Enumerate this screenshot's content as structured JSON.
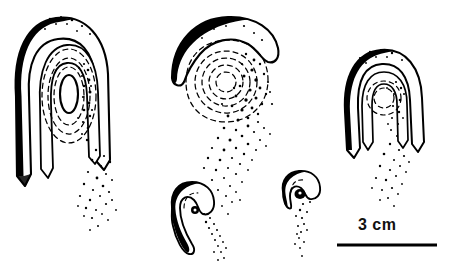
{
  "figure": {
    "background_color": "#ffffff",
    "ink_color": "#000000",
    "width": 449,
    "height": 279
  },
  "scale_bar": {
    "label": "3 cm",
    "value": 3,
    "unit": "cm",
    "bar_color": "#000000",
    "bar_x_start": 337,
    "bar_x_end": 437,
    "bar_y": 245,
    "bar_thickness": 3,
    "label_x": 358,
    "label_y": 216
  },
  "specimens": [
    {
      "id": "specimen-large-left",
      "name": "large-left-specimen",
      "description": "Large inverted-U hook with concentric dashed oval rings, solid inner oval, thick stippled left margin and descending spore trail",
      "size_class": "large",
      "center_x": 62,
      "center_y": 100,
      "has_dashed_rings": true,
      "ring_count": 4,
      "has_solid_core": true,
      "has_spore_trail": true,
      "trail_direction": "down"
    },
    {
      "id": "specimen-middle-large",
      "name": "middle-crescent-specimen",
      "description": "Crescent cap over concentric dashed circles with dense stippling dispersing downward",
      "size_class": "large",
      "center_x": 222,
      "center_y": 85,
      "has_dashed_rings": true,
      "ring_count": 5,
      "has_solid_core": false,
      "has_spore_trail": true,
      "trail_direction": "down"
    },
    {
      "id": "specimen-right",
      "name": "right-specimen",
      "description": "Medium inverted-U hook with inner oval, dashed arcs and stippled trail",
      "size_class": "medium",
      "center_x": 384,
      "center_y": 102,
      "has_dashed_rings": true,
      "ring_count": 2,
      "has_solid_core": false,
      "has_spore_trail": true,
      "trail_direction": "down"
    },
    {
      "id": "specimen-small-middle",
      "name": "small-middle-specimen",
      "description": "Small curved hook with dark dot core and diagonal stipple trail",
      "size_class": "small",
      "center_x": 190,
      "center_y": 215,
      "has_dashed_rings": false,
      "ring_count": 1,
      "has_solid_core": true,
      "has_spore_trail": true,
      "trail_direction": "down-right"
    },
    {
      "id": "specimen-small-right",
      "name": "small-right-specimen",
      "description": "Very small cap with dark blob core and vertical stipple trail",
      "size_class": "small",
      "center_x": 300,
      "center_y": 193,
      "has_dashed_rings": false,
      "ring_count": 1,
      "has_solid_core": true,
      "has_spore_trail": true,
      "trail_direction": "down"
    }
  ]
}
